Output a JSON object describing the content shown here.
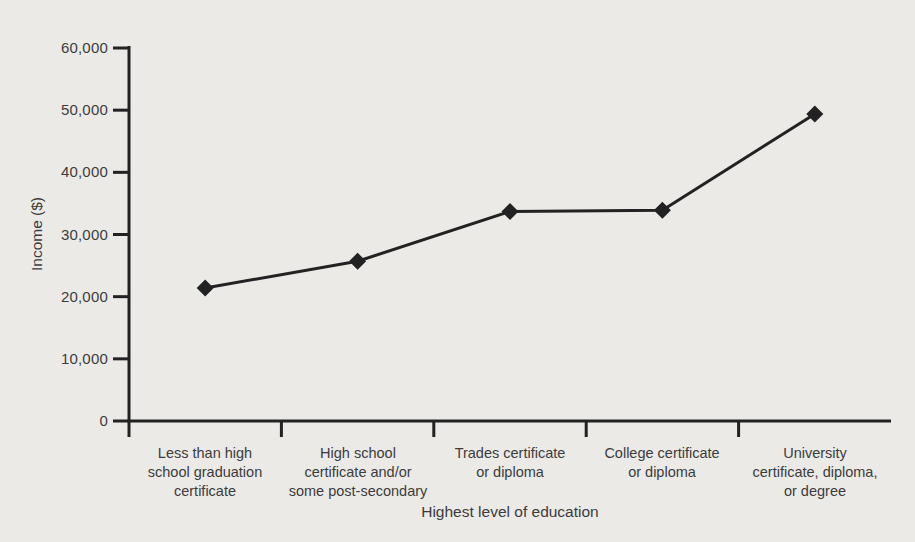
{
  "figure": {
    "background_color": "#ebeae7",
    "ink_color": "#222222",
    "text_color": "#3c3c3c"
  },
  "chart_data": {
    "type": "line",
    "title": "",
    "xlabel": "Highest level of education",
    "ylabel": "Income ($)",
    "categories": [
      "Less than high school graduation certificate",
      "High school certificate and/or some post-secondary",
      "Trades certificate or diploma",
      "College certificate or diploma",
      "University certificate, diploma, or degree"
    ],
    "categories_wrapped": [
      "Less than high\nschool graduation\ncertificate",
      "High school\ncertificate and/or\nsome post-secondary",
      "Trades certificate\nor diploma",
      "College certificate\nor diploma",
      "University\ncertificate, diploma,\nor degree"
    ],
    "values": [
      21400,
      25700,
      33700,
      33900,
      49400
    ],
    "series_name": "Income",
    "ylim": [
      0,
      60000
    ],
    "ytick_step": 10000,
    "ytick_labels": [
      "0",
      "10,000",
      "20,000",
      "30,000",
      "40,000",
      "50,000",
      "60,000"
    ],
    "grid": false,
    "legend": "none",
    "marker": "diamond",
    "line_color": "#222222"
  }
}
